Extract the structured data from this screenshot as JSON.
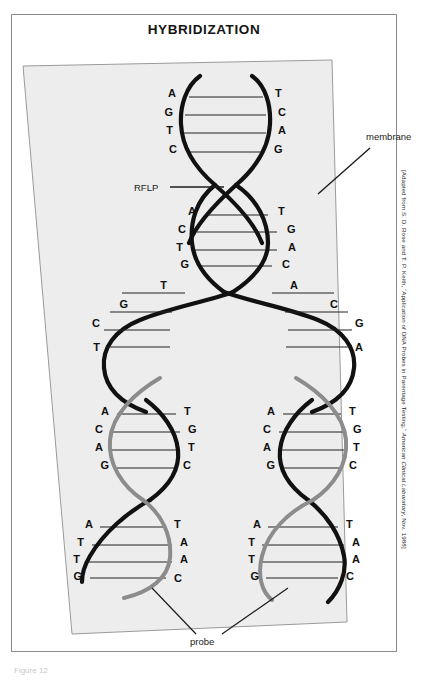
{
  "figure": {
    "title": "HYBRIDIZATION",
    "credit_prefix": "[Adapted from S. D. Rose and T. P. Keith, “Application of DNA Probes in Parentage Testing,” ",
    "credit_italic": "American Clinical Laboratory",
    "credit_suffix": ", Nov. 1988]",
    "caption": "Figure 12"
  },
  "colors": {
    "target_strand": "#111111",
    "probe_strand": "#8c8c8c",
    "membrane_fill": "#ededed",
    "membrane_edge": "#9a9a9a",
    "rung": "#222222",
    "frame": "#8b8b8b"
  },
  "annotations": {
    "membrane": "membrane",
    "rflp": "RFLP",
    "probe": "probe"
  },
  "helices": {
    "top": {
      "left_bases": [
        "A",
        "G",
        "T",
        "C"
      ],
      "right_bases": [
        "T",
        "C",
        "A",
        "G"
      ]
    },
    "second": {
      "left_bases": [
        "A",
        "C",
        "T",
        "G"
      ],
      "right_bases": [
        "T",
        "G",
        "A",
        "C"
      ]
    },
    "middle_open_left": {
      "bases": [
        "T",
        "G",
        "C",
        "T"
      ]
    },
    "middle_open_right": {
      "bases": [
        "A",
        "C",
        "G",
        "A"
      ]
    },
    "lower_left": {
      "left_bases": [
        "A",
        "C",
        "A",
        "G"
      ],
      "right_bases": [
        "T",
        "G",
        "T",
        "C"
      ]
    },
    "lower_right": {
      "left_bases": [
        "A",
        "C",
        "A",
        "G"
      ],
      "right_bases": [
        "T",
        "G",
        "T",
        "C"
      ]
    },
    "bottom_left": {
      "left_bases": [
        "A",
        "T",
        "T",
        "G"
      ],
      "right_bases": [
        "T",
        "A",
        "A",
        "C"
      ]
    },
    "bottom_right": {
      "left_bases": [
        "A",
        "T",
        "T",
        "G"
      ],
      "right_bases": [
        "T",
        "A",
        "A",
        "C"
      ]
    }
  }
}
